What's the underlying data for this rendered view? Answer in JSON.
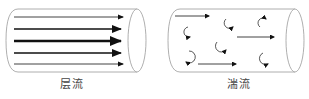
{
  "diagram": {
    "laminar": {
      "label": "层流",
      "arrows": [
        {
          "y": 17,
          "width": 1
        },
        {
          "y": 29,
          "width": 2
        },
        {
          "y": 41,
          "width": 3
        },
        {
          "y": 53,
          "width": 2
        },
        {
          "y": 64,
          "width": 1
        }
      ]
    },
    "turbulent": {
      "label": "湍流",
      "straight_arrows": 3,
      "eddies": 7
    },
    "colors": {
      "outline": "#9a9a9a",
      "arrow": "#111111",
      "label": "#444444"
    }
  }
}
